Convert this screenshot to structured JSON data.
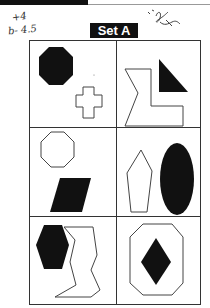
{
  "header": {
    "set_title": "Set A"
  },
  "annotations": {
    "handwritten_line1": "+4",
    "handwritten_line2": "b- 4.5",
    "scribble_note": "signature scribble"
  },
  "grid": {
    "rows": 3,
    "cols": 2,
    "cells": [
      {
        "row": 1,
        "col": 1,
        "shapes": [
          "filled octagon",
          "outlined cross"
        ]
      },
      {
        "row": 1,
        "col": 2,
        "shapes": [
          "outlined irregular L-shape",
          "filled right triangle"
        ]
      },
      {
        "row": 2,
        "col": 1,
        "shapes": [
          "outlined octagon",
          "filled parallelogram"
        ]
      },
      {
        "row": 2,
        "col": 2,
        "shapes": [
          "outlined pentagon",
          "filled ellipse"
        ]
      },
      {
        "row": 3,
        "col": 1,
        "shapes": [
          "filled hexagon",
          "outlined zigzag polygon"
        ]
      },
      {
        "row": 3,
        "col": 2,
        "shapes": [
          "outlined octagon",
          "filled diamond"
        ]
      }
    ]
  },
  "colors": {
    "ink": "#111111",
    "line": "#333333",
    "paper": "#ffffff"
  }
}
